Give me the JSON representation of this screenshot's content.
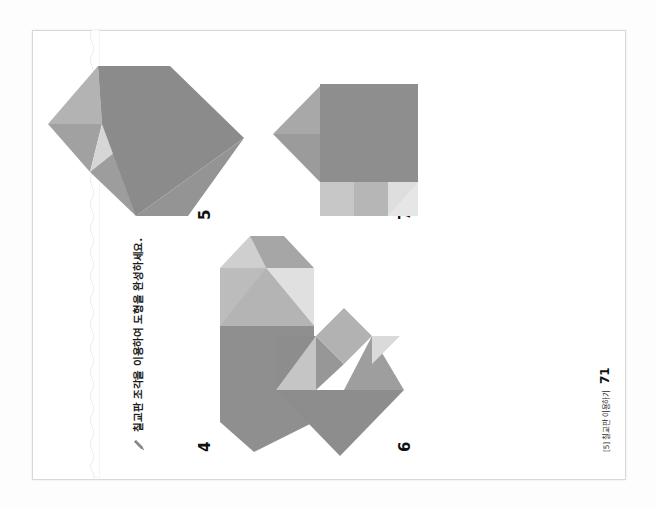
{
  "document": {
    "kind": "scanned-workbook-page",
    "orientation": "rotated-90-ccw",
    "instruction_marker": "pencil-icon",
    "instruction": "칠교판 조각을 이용하여 도형을 완성하세요.",
    "footer_tag": "[5] 칠교판 이용하기",
    "page_number": "71"
  },
  "colors": {
    "paper": "#ffffff",
    "scan_background": "#fdfdfd",
    "sheet_border": "#d8d8d8",
    "ink": "#1b1b1b",
    "tan_dark": "#8c8c8c",
    "tan_mid": "#a3a3a3",
    "tan_light": "#bdbdbd",
    "tan_pale": "#d4d4d4",
    "tan_palest": "#e3e3e3"
  },
  "problems": [
    {
      "number": "4",
      "name": "tangram-hexagon-elongated",
      "description": "가로로 긴 육각형(양 끝이 뾰족한 도형)",
      "pieces": [
        {
          "name": "large-triangle-left",
          "points": "0,36 30,0 128,0 128,96 30,96",
          "fill": "#8f8f8f"
        },
        {
          "name": "square-right",
          "points": "128,0 186,0 186,96 128,96",
          "fill": "#b9b9b9"
        },
        {
          "name": "small-triangle-upper-right",
          "points": "186,0 218,30 186,48",
          "fill": "#cacaca"
        },
        {
          "name": "small-triangle-lower-right",
          "points": "186,48 218,30 218,66 186,96",
          "fill": "#a8a8a8"
        },
        {
          "name": "triangle-bottom-notch",
          "points": "128,96 186,96 157,96",
          "fill": "#dedede"
        }
      ]
    },
    {
      "number": "5",
      "name": "tangram-hexagon-upright",
      "description": "세로로 선 육각형(위가 뾰족한 도형)",
      "pieces": [
        {
          "name": "top-left-triangle",
          "points": "62,42 110,0 110,54",
          "fill": "#a0a0a0"
        },
        {
          "name": "top-right-triangle",
          "points": "110,0 170,50 110,54",
          "fill": "#b1b1b1"
        },
        {
          "name": "small-light-triangle",
          "points": "62,42 110,54 86,72",
          "fill": "#d2d2d2"
        },
        {
          "name": "left-parallelogram",
          "points": "18,88 62,42 86,72 42,118",
          "fill": "#9b9b9b"
        },
        {
          "name": "large-bottom-triangle",
          "points": "18,88 110,54 170,50 170,122 96,196",
          "fill": "#8b8b8b"
        },
        {
          "name": "bottom-left-wedge",
          "points": "18,88 18,140 96,196",
          "fill": "#949494"
        }
      ]
    },
    {
      "number": "6",
      "name": "tangram-arrow-chevron",
      "description": "왼쪽을 가리키는 화살표 모양 도형",
      "pieces": [
        {
          "name": "large-arrow-head",
          "points": "0,64 66,0 66,128",
          "fill": "#8d8d8d"
        },
        {
          "name": "upper-shaft-triangle",
          "points": "66,0 122,0 122,40",
          "fill": "#8d8d8d"
        },
        {
          "name": "upper-light-triangle",
          "points": "66,0 66,40 122,40",
          "fill": "#c3c3c3"
        },
        {
          "name": "mid-notch-triangle",
          "points": "66,40 122,40 94,68",
          "fill": "#979797"
        },
        {
          "name": "right-small-square",
          "points": "94,68 122,40 150,68 122,96",
          "fill": "#b0b0b0"
        },
        {
          "name": "lower-shaft-triangle",
          "points": "66,68 122,96 66,128",
          "fill": "#9d9d9d"
        },
        {
          "name": "lower-pale-triangle",
          "points": "94,96 122,96 122,124",
          "fill": "#d8d8d8"
        }
      ]
    },
    {
      "number": "7",
      "name": "tangram-house-square",
      "description": "집 모양(지붕이 있는 사각형) 도형",
      "pieces": [
        {
          "name": "roof-left-triangle",
          "points": "48,52 96,6 96,52",
          "fill": "#9a9a9a"
        },
        {
          "name": "roof-right-triangle",
          "points": "96,6 146,54 96,52",
          "fill": "#a6a6a6"
        },
        {
          "name": "left-upper-square",
          "points": "14,52 48,52 48,86 14,86",
          "fill": "#c5c5c5"
        },
        {
          "name": "left-parallelogram",
          "points": "14,52 48,52 48,86 14,86",
          "fill": "#c0c0c0"
        },
        {
          "name": "body-large-square",
          "points": "48,52 146,52 146,150 48,150",
          "fill": "#8e8e8e"
        },
        {
          "name": "left-lower-triangle",
          "points": "14,86 48,86 48,120 14,120",
          "fill": "#b4b4b4"
        },
        {
          "name": "bottom-left-wedge",
          "points": "14,120 48,120 48,150 28,150",
          "fill": "#dcdcdc"
        }
      ]
    }
  ]
}
